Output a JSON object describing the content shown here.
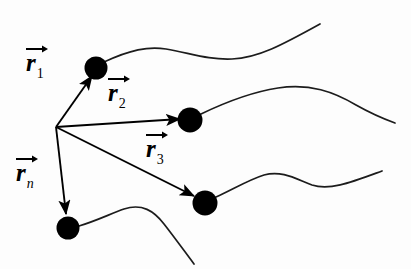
{
  "figure": {
    "background_color": "#fdfdfd",
    "ink_color": "#000000",
    "origin": {
      "label": "origin",
      "x": 56,
      "y": 127
    },
    "labels": [
      {
        "name": "r1",
        "base": "r",
        "subscript": "1",
        "subscript_italic": false,
        "x": 26,
        "y": 50,
        "arrow_icon": "vector-arrow-icon"
      },
      {
        "name": "r2",
        "base": "r",
        "subscript": "2",
        "subscript_italic": false,
        "x": 108,
        "y": 80,
        "arrow_icon": "vector-arrow-icon"
      },
      {
        "name": "r3",
        "base": "r",
        "subscript": "3",
        "subscript_italic": false,
        "x": 146,
        "y": 136,
        "arrow_icon": "vector-arrow-icon"
      },
      {
        "name": "rn",
        "base": "r",
        "subscript": "n",
        "subscript_italic": true,
        "x": 16,
        "y": 160,
        "arrow_icon": "vector-arrow-icon"
      }
    ],
    "vectors": [
      {
        "name": "vector-r1",
        "from": [
          56,
          127
        ],
        "to": [
          92,
          76
        ],
        "label": "r1"
      },
      {
        "name": "vector-r2",
        "from": [
          56,
          127
        ],
        "to": [
          180,
          119
        ],
        "label": "r2"
      },
      {
        "name": "vector-r3",
        "from": [
          56,
          127
        ],
        "to": [
          194,
          196
        ],
        "label": "r3"
      },
      {
        "name": "vector-rn",
        "from": [
          56,
          127
        ],
        "to": [
          66,
          214
        ],
        "label": "rn"
      }
    ],
    "particles": [
      {
        "name": "particle-1",
        "cx": 96,
        "cy": 68,
        "r": 11.5
      },
      {
        "name": "particle-2",
        "cx": 190,
        "cy": 120,
        "r": 12.5
      },
      {
        "name": "particle-3",
        "cx": 205,
        "cy": 203,
        "r": 12.5
      },
      {
        "name": "particle-n",
        "cx": 68,
        "cy": 228,
        "r": 11.5
      }
    ],
    "trajectories": [
      {
        "name": "trajectory-1",
        "path": "M 104 62 C 130 50 148 46 166 49 C 190 53 208 60 232 59 C 258 58 282 45 320 24"
      },
      {
        "name": "trajectory-2",
        "path": "M 201 114 C 228 101 252 92 278 88 C 310 83 334 92 356 105 C 372 114 384 119 395 123"
      },
      {
        "name": "trajectory-3",
        "path": "M 216 197 C 232 190 248 180 264 175 C 282 170 296 179 312 185 C 330 191 352 182 382 171"
      },
      {
        "name": "trajectory-n",
        "path": "M 79 226 C 96 221 110 214 124 209 C 142 203 154 211 164 224 C 175 238 185 252 194 264"
      }
    ]
  }
}
